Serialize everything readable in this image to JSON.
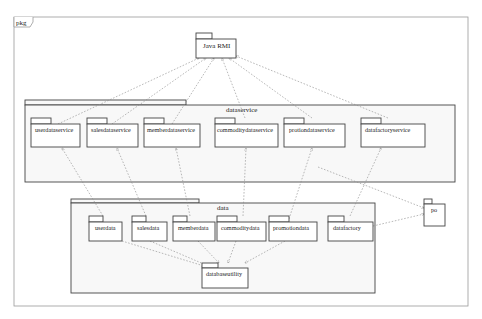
{
  "diagram": {
    "frame_label": "pkg",
    "top_package": {
      "name": "Java RMI"
    },
    "dataservice": {
      "name": "dataservice",
      "packages": [
        {
          "name": "userdataservice"
        },
        {
          "name": "salesdataservice"
        },
        {
          "name": "memberdataservice"
        },
        {
          "name": "commoditydataservice"
        },
        {
          "name": "protiondataservice"
        },
        {
          "name": "datafactoryservice"
        }
      ]
    },
    "data": {
      "name": "data",
      "packages": [
        {
          "name": "userdata"
        },
        {
          "name": "salesdata"
        },
        {
          "name": "memberdata"
        },
        {
          "name": "commoditydata"
        },
        {
          "name": "promotiondata"
        },
        {
          "name": "datafactory"
        }
      ],
      "utility": {
        "name": "databaseutility"
      }
    },
    "po": {
      "name": "po"
    },
    "dependencies": [
      [
        "userdataservice",
        "Java RMI"
      ],
      [
        "salesdataservice",
        "Java RMI"
      ],
      [
        "memberdataservice",
        "Java RMI"
      ],
      [
        "commoditydataservice",
        "Java RMI"
      ],
      [
        "protiondataservice",
        "Java RMI"
      ],
      [
        "datafactoryservice",
        "Java RMI"
      ],
      [
        "userdata",
        "userdataservice"
      ],
      [
        "salesdata",
        "salesdataservice"
      ],
      [
        "memberdata",
        "memberdataservice"
      ],
      [
        "commoditydata",
        "commoditydataservice"
      ],
      [
        "promotiondata",
        "protiondataservice"
      ],
      [
        "datafactory",
        "datafactoryservice"
      ],
      [
        "salesdata",
        "databaseutility"
      ],
      [
        "memberdata",
        "databaseutility"
      ],
      [
        "commoditydata",
        "databaseutility"
      ],
      [
        "promotiondata",
        "databaseutility"
      ],
      [
        "userdata",
        "databaseutility"
      ],
      [
        "dataservice",
        "po"
      ],
      [
        "datafactory",
        "po"
      ]
    ],
    "colors": {
      "line": "#444444",
      "dashed": "#8a8a8a",
      "frame_fill": "#f8f8f8"
    }
  }
}
